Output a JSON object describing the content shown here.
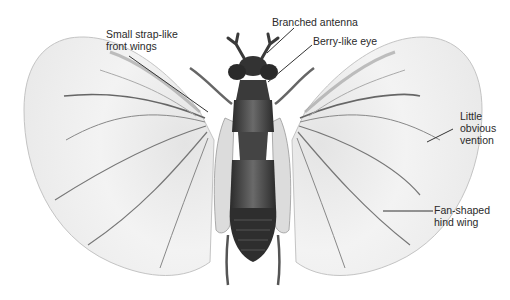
{
  "figure": {
    "labels": [
      {
        "id": "front-wings",
        "lines": [
          "Small strap-like",
          "front wings"
        ]
      },
      {
        "id": "antenna",
        "lines": [
          "Branched antenna"
        ]
      },
      {
        "id": "eye",
        "lines": [
          "Berry-like eye"
        ]
      },
      {
        "id": "vention",
        "lines": [
          "Little",
          "obvious",
          "vention"
        ]
      },
      {
        "id": "hind-wing",
        "lines": [
          "Fan-shaped",
          "hind wing"
        ]
      }
    ]
  },
  "colors": {
    "background": "#ffffff",
    "wing_fill": "#f2f2f2",
    "wing_edge": "#c8c8c8",
    "vein": "#6e6e6e",
    "body_dark": "#2e2e2e",
    "body_mid": "#555555",
    "leader_line": "#333333",
    "text": "#2a2a2a"
  }
}
